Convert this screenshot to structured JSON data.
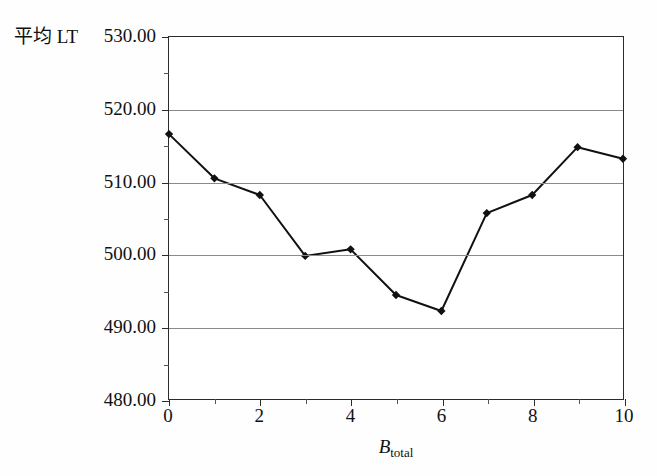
{
  "chart_data": {
    "type": "line",
    "title": "",
    "xlabel": "B_total",
    "xlabel_base": "B",
    "xlabel_sub": "total",
    "ylabel": "平均 LT",
    "x": [
      0,
      1,
      2,
      3,
      4,
      5,
      6,
      7,
      8,
      9,
      10
    ],
    "values": [
      516.6,
      510.5,
      508.2,
      499.8,
      500.7,
      494.4,
      492.2,
      505.7,
      508.2,
      514.8,
      513.2
    ],
    "series": [
      {
        "name": "平均 LT",
        "values": [
          516.6,
          510.5,
          508.2,
          499.8,
          500.7,
          494.4,
          492.2,
          505.7,
          508.2,
          514.8,
          513.2
        ]
      }
    ],
    "xlim": [
      0,
      10
    ],
    "ylim": [
      480,
      530
    ],
    "x_major_ticks": [
      0,
      2,
      4,
      6,
      8,
      10
    ],
    "x_minor_ticks": [
      1,
      3,
      5,
      7,
      9
    ],
    "x_tick_labels": [
      "0",
      "2",
      "4",
      "6",
      "8",
      "10"
    ],
    "y_major_ticks": [
      480,
      490,
      500,
      510,
      520,
      530
    ],
    "y_minor_ticks": [
      485,
      495,
      505,
      515,
      525
    ],
    "y_tick_labels": [
      "480.00",
      "490.00",
      "500.00",
      "510.00",
      "520.00",
      "530.00"
    ],
    "grid": true,
    "grid_axis": "y",
    "legend": "none",
    "marker": "diamond",
    "line_color": "#111111",
    "marker_color": "#111111",
    "grid_color": "#8a8a8a",
    "frame_color": "#2b2b2b",
    "background": "#ffffff"
  }
}
